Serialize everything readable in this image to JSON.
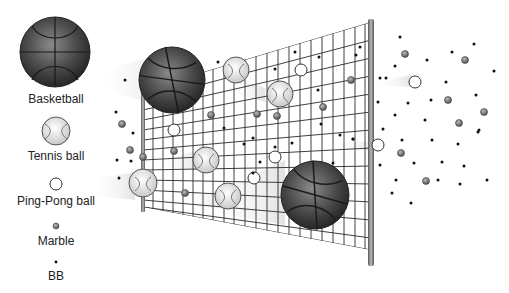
{
  "legend": {
    "items": [
      {
        "label": "Basketball",
        "icon": "basketball-icon"
      },
      {
        "label": "Tennis ball",
        "icon": "tennis-ball-icon"
      },
      {
        "label": "Ping-Pong ball",
        "icon": "ping-pong-ball-icon"
      },
      {
        "label": "Marble",
        "icon": "marble-icon"
      },
      {
        "label": "BB",
        "icon": "bb-icon"
      }
    ]
  },
  "colors": {
    "basketball": "#3a3a3a",
    "tennis_ball": "#e6e6e6",
    "ping_pong": "#ffffff",
    "marble": "#808080",
    "bb": "#111111",
    "net": "#333333",
    "pole": "#777777"
  }
}
